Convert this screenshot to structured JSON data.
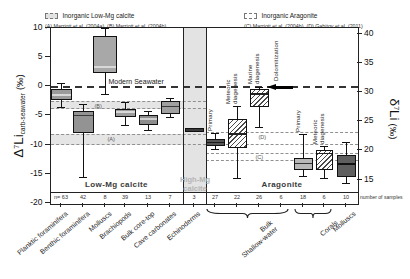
{
  "legend_low_mg": {
    "title": "Inorganic Low-Mg calcite",
    "refs": "(A) Marriott et al. (2004a), (B) Marriott et al. (2004b)"
  },
  "legend_aragonite": {
    "title": "Inorganic Aragonite",
    "refs": "(C) Marriott et al. (2004b), (D) Gabitov et al. (2011)"
  },
  "left_axis": {
    "symbol": "Δ",
    "isotope": "7",
    "element": "Li",
    "subscript": "carb-seawater",
    "units": "(‰)"
  },
  "right_axis": {
    "symbol": "δ",
    "isotope": "7",
    "element": "Li",
    "units": "(‰)"
  },
  "number_of_samples_label": "number of samples",
  "chart_data": {
    "type": "boxplot",
    "y_axis_left": {
      "label": "Δ7Li carb-seawater (‰)",
      "ticks": [
        10,
        5,
        0,
        -5,
        -10,
        -15,
        -20
      ],
      "range": [
        -20.2,
        10
      ]
    },
    "y_axis_right": {
      "label": "δ7Li (‰)",
      "ticks": [
        40,
        35,
        30,
        25,
        20,
        15
      ],
      "offset_from_left_axis": 31
    },
    "seawater_line": {
      "label": "Modern Seawater",
      "value": 0
    },
    "sections": [
      {
        "id": "low-mg",
        "label": "Low-Mg calcite"
      },
      {
        "id": "high-mg",
        "label": "High-Mg calcite",
        "shaded_column": true
      },
      {
        "id": "aragonite",
        "label": "Aragonite"
      }
    ],
    "reference_bands": [
      {
        "id": "B",
        "label": "(B)",
        "top": -2.6,
        "bottom": -3.9,
        "section": "calcite",
        "shaded": true
      },
      {
        "id": "A",
        "label": "(A)",
        "top": -8.2,
        "bottom": -10.0,
        "section": "calcite",
        "shaded": true
      },
      {
        "id": "D",
        "label": "(D)",
        "top": -7.9,
        "bottom": -10.1,
        "section": "aragonite",
        "shaded": false
      },
      {
        "id": "C",
        "label": "(C)",
        "top": -11.4,
        "bottom": -12.8,
        "section": "aragonite",
        "shaded": false
      }
    ],
    "categories": [
      {
        "name": "Planktic foraminifera",
        "n": 63,
        "section": "low-mg",
        "whisker_high": 0.5,
        "q3": -0.5,
        "median": -1.5,
        "q1": -2.4,
        "whisker_low": -3.7,
        "fill": "#9b9b9b",
        "hatch": false,
        "median_color": "#d8d8d8",
        "width": 21
      },
      {
        "name": "Benthic foraminifera",
        "n": 42,
        "section": "low-mg",
        "whisker_high": -3.1,
        "q3": -4.2,
        "median": -5.0,
        "q1": -8.0,
        "whisker_low": -15.6,
        "fill": "#939393",
        "hatch": false,
        "median_color": "#3a3a3a",
        "width": 21
      },
      {
        "name": "Molluscs",
        "n": 8,
        "section": "low-mg",
        "whisker_high": 9.9,
        "q3": 8.7,
        "median": 3.3,
        "q1": 2.3,
        "whisker_low": -1.4,
        "fill": "#a8a8a8",
        "hatch": false,
        "median_color": "#d8d8d8",
        "width": 24
      },
      {
        "name": "Brachiopods",
        "n": 39,
        "section": "low-mg",
        "whisker_high": -2.8,
        "q3": -3.9,
        "median": -4.4,
        "q1": -5.3,
        "whisker_low": -6.7,
        "fill": "#9b9b9b",
        "hatch": false,
        "median_color": "#d8d8d8",
        "width": 21
      },
      {
        "name": "Bulk core-top",
        "n": 13,
        "section": "low-mg",
        "whisker_high": -4.4,
        "q3": -4.9,
        "median": -5.6,
        "q1": -6.7,
        "whisker_low": -7.6,
        "fill": "#8d8d8d",
        "hatch": false,
        "median_color": "#cfcfcf",
        "width": 19
      },
      {
        "name": "Cave carbonates",
        "n": 7,
        "section": "low-mg",
        "whisker_high": -2.1,
        "q3": -2.6,
        "median": -3.5,
        "q1": -4.7,
        "whisker_low": -5.3,
        "fill": "#a0a0a0",
        "hatch": false,
        "median_color": "#3a3a3a",
        "width": 19
      },
      {
        "name": "Echinoderms",
        "n": 3,
        "section": "high-mg",
        "whisker_high": null,
        "q3": -7.2,
        "median": -7.5,
        "q1": -7.9,
        "whisker_low": null,
        "fill": "#6e6e6e",
        "hatch": false,
        "median_color": "#3a3a3a",
        "width": 19
      },
      {
        "name": "Primary",
        "sublabel": "Primary",
        "n": 27,
        "section": "aragonite",
        "whisker_high": -8.1,
        "q3": -9.1,
        "median": -9.6,
        "q1": -10.2,
        "whisker_low": -10.9,
        "fill": "#555555",
        "hatch": false,
        "median_color": "#1a1a1a",
        "width": 19
      },
      {
        "name": "Meteoric diagenesis",
        "sublabel": "Meteoric\ndiagenesis",
        "n": 22,
        "section": "aragonite",
        "whisker_high": -3.5,
        "q3": -5.6,
        "median": -8.2,
        "q1": -10.5,
        "whisker_low": -15.8,
        "fill": "#ffffff",
        "hatch": true,
        "median_color": "#222222",
        "width": 19
      },
      {
        "name": "Marine diagenesis",
        "sublabel": "Marine\ndiagenesis",
        "n": 26,
        "section": "aragonite",
        "whisker_high": -0.2,
        "q3": -0.5,
        "median": -1.3,
        "q1": -3.5,
        "whisker_low": -7.0,
        "fill": "#ffffff",
        "hatch": true,
        "median_color": "#222222",
        "width": 19
      },
      {
        "name": "Dolomitization",
        "sublabel": "Dolomitization",
        "n": 6,
        "section": "aragonite",
        "type": "arrow",
        "value": -0.2
      },
      {
        "name": "Corals Primary",
        "sublabel": "Primary",
        "n": 18,
        "section": "aragonite",
        "whisker_high": -8.3,
        "q3": -12.3,
        "median": -13.2,
        "q1": -14.4,
        "whisker_low": -15.4,
        "fill": "#b8b8b8",
        "hatch": false,
        "median_color": "#333333",
        "width": 19
      },
      {
        "name": "Corals Meteoric diagenesis",
        "sublabel": "Meteoric\ndiagenesis",
        "n": 6,
        "section": "aragonite",
        "whisker_high": -10.4,
        "q3": -11.0,
        "median": -11.5,
        "q1": -14.4,
        "whisker_low": -15.8,
        "fill": "#ffffff",
        "hatch": true,
        "median_color": "#222222",
        "width": 17
      },
      {
        "name": "Molluscs",
        "n": 10,
        "section": "aragonite",
        "whisker_high": -9.6,
        "q3": -11.8,
        "median": -13.3,
        "q1": -15.6,
        "whisker_low": -16.6,
        "fill": "#5f5f5f",
        "hatch": false,
        "median_color": "#111111",
        "width": 19
      }
    ],
    "bottom_groups": [
      {
        "label": "Bulk\nShallow-water",
        "start_idx": 7,
        "end_idx": 10,
        "brace": true
      },
      {
        "label": "Corals",
        "start_idx": 11,
        "end_idx": 12,
        "brace": true
      },
      {
        "label": "Molluscs",
        "start_idx": 13,
        "end_idx": 13,
        "brace": false
      }
    ]
  }
}
